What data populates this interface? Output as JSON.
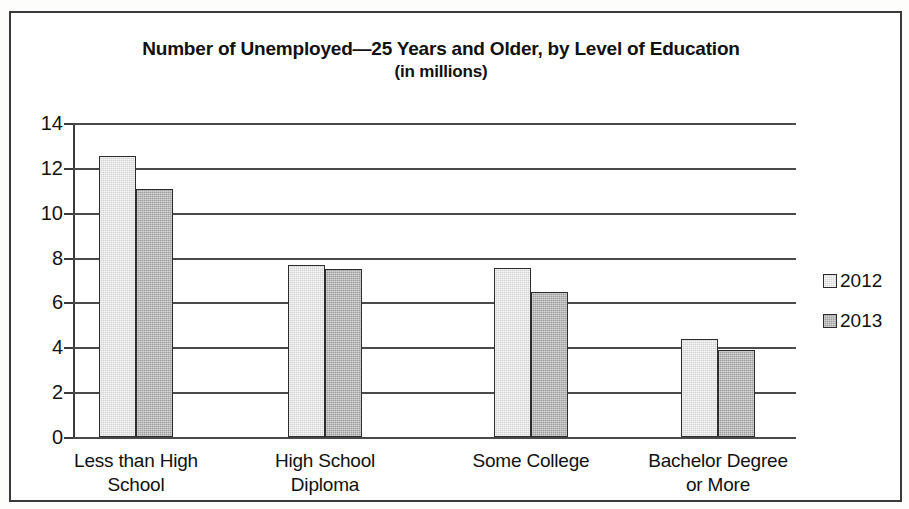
{
  "chart_data": {
    "type": "bar",
    "title": "Number of Unemployed—25 Years and Older, by Level of Education",
    "subtitle": "(in millions)",
    "xlabel": "",
    "ylabel": "",
    "ylim": [
      0,
      14
    ],
    "ytick_labels": [
      "14",
      "12",
      "10",
      "8",
      "6",
      "4",
      "2",
      "0"
    ],
    "ytick_values": [
      14,
      12,
      10,
      8,
      6,
      4,
      2,
      0
    ],
    "grid": true,
    "legend_position": "right",
    "categories": [
      "Less than High School",
      "High School Diploma",
      "Some College",
      "Bachelor Degree or More"
    ],
    "category_lines": [
      [
        "Less than High",
        "School"
      ],
      [
        "High School",
        "Diploma"
      ],
      [
        "Some College"
      ],
      [
        "Bachelor Degree",
        "or More"
      ]
    ],
    "series": [
      {
        "name": "2012",
        "color": "#d2d2d2",
        "values": [
          12.55,
          7.65,
          7.55,
          4.35
        ]
      },
      {
        "name": "2013",
        "color": "#9f9f9f",
        "values": [
          11.05,
          7.5,
          6.45,
          3.9
        ]
      }
    ]
  },
  "legend": {
    "items": [
      {
        "label": "2012",
        "swatch": "light-gray-swatch"
      },
      {
        "label": "2013",
        "swatch": "dark-gray-swatch"
      }
    ]
  },
  "colors": {
    "series_2012": "#d2d2d2",
    "series_2013": "#9f9f9f",
    "axis": "#3a3a3a",
    "grid": "#4a4a4a",
    "text": "#111111",
    "background": "#ffffff"
  }
}
